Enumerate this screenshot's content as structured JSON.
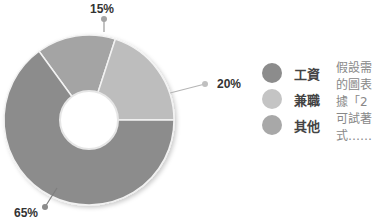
{
  "chart_data": {
    "type": "pie",
    "variant": "donut",
    "title": "",
    "categories": [
      "工資",
      "兼職",
      "其他"
    ],
    "values": [
      65,
      20,
      15
    ],
    "labels": [
      "65%",
      "20%",
      "15%"
    ],
    "colors": [
      "#8c8c8c",
      "#bdbdbd",
      "#a4a4a4"
    ],
    "legend_position": "right",
    "start_angle_deg": -36
  },
  "labels": {
    "top": "15%",
    "right": "20%",
    "bottom_left": "65%"
  },
  "legend": {
    "items": [
      {
        "label": "工資",
        "color": "#8c8c8c"
      },
      {
        "label": "兼職",
        "color": "#c4c4c4"
      },
      {
        "label": "其他",
        "color": "#a8a8a8"
      }
    ]
  },
  "side_text": {
    "lines": [
      "假設需",
      "的圖表",
      "據「2",
      "可試著",
      "式……"
    ]
  }
}
